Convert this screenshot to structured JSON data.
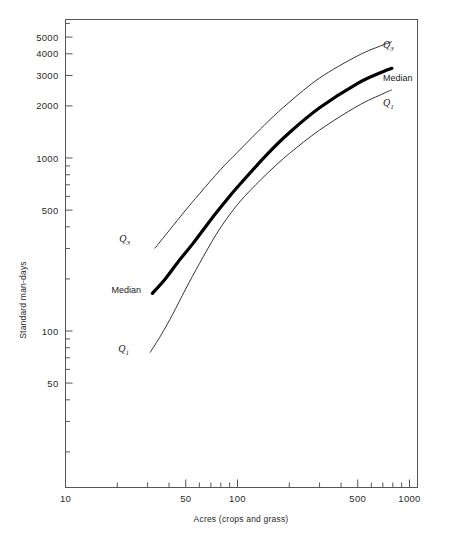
{
  "figure": {
    "background_color": "#ffffff",
    "frame_color": "#555555",
    "caption_partial": ""
  },
  "chart_data": {
    "type": "line",
    "title": "",
    "subtitle": "",
    "xlabel": "Acres (crops and grass)",
    "ylabel": "Standard man-days",
    "xscale": "log",
    "yscale": "log",
    "xlim": [
      10,
      2000
    ],
    "ylim": [
      20,
      7000
    ],
    "grid": false,
    "legend": "inline-curve-labels",
    "x_tick_labels": [
      "10",
      "50",
      "100",
      "500",
      "1000"
    ],
    "x_tick_values": [
      10,
      50,
      100,
      500,
      1000
    ],
    "x_minor_ticks": [
      20,
      30,
      40,
      60,
      70,
      80,
      90,
      200,
      300,
      400,
      600,
      700,
      800,
      900,
      2000
    ],
    "y_tick_labels": [
      "50",
      "100",
      "500",
      "1000",
      "2000",
      "3000",
      "4000",
      "5000"
    ],
    "y_tick_values": [
      50,
      100,
      500,
      1000,
      2000,
      3000,
      4000,
      5000
    ],
    "y_minor_ticks": [
      20,
      30,
      40,
      60,
      70,
      80,
      90,
      200,
      300,
      400,
      600,
      700,
      800,
      900,
      6000,
      7000
    ],
    "series": [
      {
        "name": "Q3",
        "label": "Q",
        "label_sub": "3",
        "style": "thin",
        "label_left_xy": [
          33,
          300
        ],
        "label_right_xy": [
          800,
          4100
        ],
        "points": [
          [
            33,
            300
          ],
          [
            40,
            380
          ],
          [
            50,
            500
          ],
          [
            60,
            620
          ],
          [
            80,
            860
          ],
          [
            100,
            1080
          ],
          [
            150,
            1620
          ],
          [
            200,
            2100
          ],
          [
            300,
            2900
          ],
          [
            500,
            3900
          ],
          [
            700,
            4500
          ],
          [
            790,
            4700
          ]
        ]
      },
      {
        "name": "Median",
        "label": "Median",
        "label_sub": "",
        "style": "thick",
        "label_left_xy": [
          33,
          165
        ],
        "label_right_xy": [
          800,
          2800
        ],
        "points": [
          [
            32,
            165
          ],
          [
            38,
            200
          ],
          [
            45,
            250
          ],
          [
            55,
            320
          ],
          [
            70,
            440
          ],
          [
            85,
            560
          ],
          [
            100,
            680
          ],
          [
            150,
            1060
          ],
          [
            200,
            1400
          ],
          [
            300,
            1950
          ],
          [
            500,
            2700
          ],
          [
            700,
            3150
          ],
          [
            790,
            3300
          ]
        ]
      },
      {
        "name": "Q1",
        "label": "Q",
        "label_sub": "1",
        "style": "thin",
        "label_left_xy": [
          31,
          75
        ],
        "label_right_xy": [
          800,
          2050
        ],
        "points": [
          [
            31,
            75
          ],
          [
            36,
            95
          ],
          [
            42,
            125
          ],
          [
            50,
            175
          ],
          [
            60,
            245
          ],
          [
            75,
            360
          ],
          [
            90,
            470
          ],
          [
            110,
            600
          ],
          [
            150,
            820
          ],
          [
            200,
            1060
          ],
          [
            300,
            1450
          ],
          [
            500,
            2000
          ],
          [
            700,
            2350
          ],
          [
            790,
            2480
          ]
        ]
      }
    ]
  },
  "labels": {
    "y_axis_title": "Standard man-days",
    "x_axis_title": "Acres (crops and grass)",
    "q3_left": "Q",
    "q3_left_sub": "3",
    "q3_right": "Q",
    "q3_right_sub": "3",
    "median_left": "Median",
    "median_right": "Median",
    "q1_left": "Q",
    "q1_left_sub": "1",
    "q1_right": "Q",
    "q1_right_sub": "1"
  }
}
